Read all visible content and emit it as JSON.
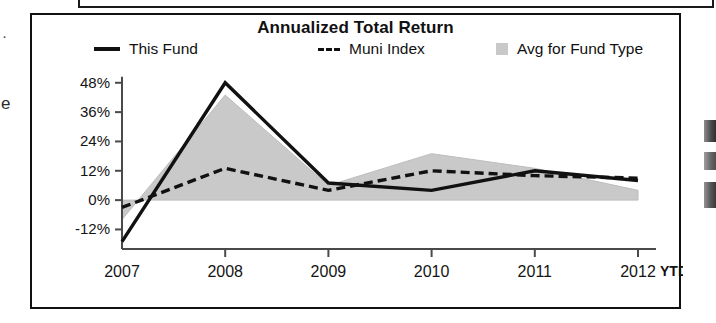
{
  "chart_data": {
    "type": "line",
    "title": "Annualized Total Return",
    "xlabel": "",
    "ylabel": "",
    "x": [
      "2007",
      "2008",
      "2009",
      "2010",
      "2011",
      "2012"
    ],
    "x_suffix_label": "YTD",
    "categories": [
      "2007",
      "2008",
      "2009",
      "2010",
      "2011",
      "2012"
    ],
    "ytick_labels": [
      "48%",
      "36%",
      "24%",
      "12%",
      "0%",
      "-12%"
    ],
    "ytick_values": [
      48,
      36,
      24,
      12,
      0,
      -12
    ],
    "ylim": [
      -20,
      52
    ],
    "grid": false,
    "legend_position": "top",
    "series": [
      {
        "name": "This Fund",
        "style": "solid-line",
        "color": "#111111",
        "values": [
          -17,
          48,
          7,
          4,
          12,
          8
        ]
      },
      {
        "name": "Muni Index",
        "style": "dashed-line",
        "color": "#111111",
        "values": [
          -3,
          13,
          4,
          12,
          10,
          9
        ]
      },
      {
        "name": "Avg for Fund Type",
        "style": "filled-area",
        "color": "#c9c9c9",
        "values": [
          -8,
          43,
          6,
          19,
          13,
          4
        ]
      }
    ]
  },
  "legend": {
    "items": [
      {
        "label": "This Fund",
        "marker": "solid-line-marker"
      },
      {
        "label": "Muni Index",
        "marker": "dashed-line-marker"
      },
      {
        "label": "Avg for Fund Type",
        "marker": "gray-square-marker"
      }
    ]
  },
  "artifacts": {
    "left_fragment_top": "·",
    "left_fragment_bottom": "e"
  }
}
